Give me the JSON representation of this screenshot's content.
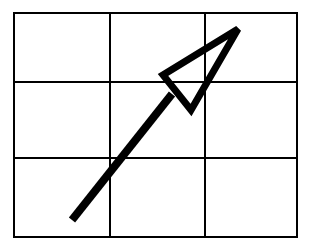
{
  "diagram": {
    "type": "grid-with-arrow",
    "background_color": "#ffffff",
    "stroke_color": "#000000",
    "grid": {
      "rows": 3,
      "columns": 3,
      "left": 14,
      "top": 13,
      "right": 297,
      "bottom": 237,
      "column_lines_x": [
        14,
        110,
        205,
        297
      ],
      "row_lines_y": [
        13,
        82,
        158,
        237
      ],
      "line_width": 2
    },
    "arrow": {
      "direction": "up-right",
      "shaft": {
        "x1": 72,
        "y1": 220,
        "x2": 172,
        "y2": 94,
        "width": 8
      },
      "head": {
        "style": "open-triangle",
        "tip": [
          238,
          29
        ],
        "back_left": [
          163,
          75
        ],
        "back_right": [
          191,
          110
        ],
        "stroke_width": 7
      }
    }
  }
}
